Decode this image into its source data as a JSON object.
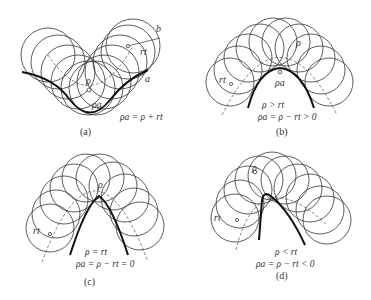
{
  "figure": {
    "panels": [
      {
        "id": "a",
        "caption": "(a)",
        "labels": {
          "b": "b",
          "a": "a",
          "rt": "rt",
          "rho": "ρ",
          "rho_a": "ρa"
        },
        "equations": [
          "ρa = ρ + rt"
        ]
      },
      {
        "id": "b",
        "caption": "(b)",
        "labels": {
          "rt": "rt",
          "rho": "ρ",
          "rho_a": "ρa"
        },
        "equations": [
          "ρ > rt",
          "ρa = ρ − rt > 0"
        ]
      },
      {
        "id": "c",
        "caption": "(c)",
        "labels": {
          "rt": "rt",
          "rho": "ρ"
        },
        "equations": [
          "ρ = rt",
          "ρa = ρ − rt = 0"
        ]
      },
      {
        "id": "d",
        "caption": "(d)",
        "labels": {
          "rt": "rt",
          "rho": "ρ"
        },
        "equations": [
          "ρ < rt",
          "ρa = ρ − rt < 0"
        ]
      }
    ],
    "colors": {
      "stroke": "#2a2a2a",
      "background": "#ffffff"
    }
  }
}
